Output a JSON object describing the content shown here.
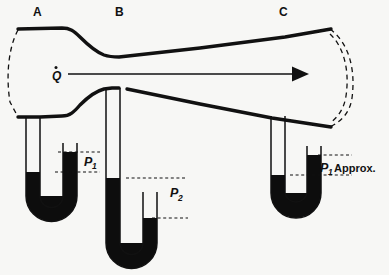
{
  "figure": {
    "background_color": "#f7f7f5",
    "ink_color": "#111111",
    "mercury_color": "#0d0d0d",
    "width": 389,
    "height": 275
  },
  "stations": [
    {
      "id": "A",
      "label": "A",
      "x": 37,
      "y": 14,
      "role": "upstream-inlet"
    },
    {
      "id": "B",
      "label": "B",
      "x": 119,
      "y": 14,
      "role": "throat"
    },
    {
      "id": "C",
      "label": "C",
      "x": 283,
      "y": 14,
      "role": "downstream-outlet"
    }
  ],
  "flow": {
    "symbol": "Q",
    "accent": "dot",
    "description": "volumetric flow rate",
    "label_x": 56,
    "label_y": 79,
    "arrow_start_x": 66,
    "arrow_end_x": 300,
    "arrow_y": 74,
    "direction": "right"
  },
  "manometers": [
    {
      "id": "manometer-a",
      "station": "A",
      "label": "P",
      "subscript": "1",
      "suffix": "",
      "label_x": 88,
      "label_y": 164,
      "tap_x": 36,
      "tap_top_y": 120,
      "left_limb_x": 31,
      "right_limb_x": 72,
      "limb_width": 14,
      "bottom_y": 215,
      "left_level_y": 172,
      "right_level_y": 152,
      "upper_dotted_y": 152,
      "lower_dotted_y": 172,
      "dotted_x1": 60,
      "dotted_x2": 100
    },
    {
      "id": "manometer-b",
      "station": "B",
      "label": "P",
      "subscript": "2",
      "suffix": "",
      "label_x": 176,
      "label_y": 196,
      "tap_x": 119,
      "tap_top_y": 88,
      "left_limb_x": 112,
      "right_limb_x": 152,
      "limb_width": 14,
      "bottom_y": 262,
      "left_level_y": 178,
      "right_level_y": 218,
      "upper_dotted_y": 178,
      "lower_dotted_y": 218,
      "dotted_x1": 128,
      "dotted_x2": 185
    },
    {
      "id": "manometer-c",
      "station": "C",
      "label": "P",
      "subscript": "1",
      "suffix": "Approx.",
      "label_x": 322,
      "label_y": 170,
      "suffix_x": 336,
      "suffix_y": 170,
      "tap_x": 281,
      "tap_top_y": 118,
      "left_limb_x": 276,
      "right_limb_x": 315,
      "limb_width": 14,
      "bottom_y": 212,
      "left_level_y": 175,
      "right_level_y": 155,
      "upper_dotted_y": 155,
      "lower_dotted_y": 175,
      "dotted_x1": 300,
      "dotted_x2": 348
    }
  ],
  "duct": {
    "upper_wall_points": "18,29 60,28 72,29 84,37 96,49 108,56 118,57 200,48 280,38 330,30",
    "lower_wall_points": "18,117 40,117 62,116 78,104 92,95 108,90 119,89 200,105 272,119 330,127",
    "wall_thickness": 3.2,
    "left_break": "18,30 8,52 7,78 10,104 18,117",
    "right_break_outer": "330,30 348,42 354,68 352,98 344,118 330,127",
    "right_break_inner": "330,33 343,45 349,69 347,97 340,115 330,124"
  }
}
